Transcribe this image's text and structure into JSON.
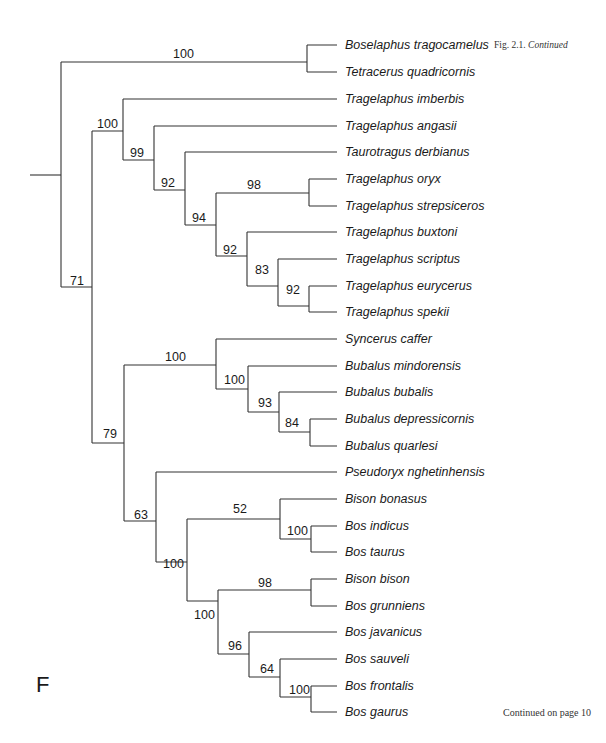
{
  "caption": {
    "figure": "Fig. 2.1.",
    "continued": "Continued"
  },
  "panel_letter": "F",
  "footer": "Continued on page 10",
  "tree": {
    "line_color": "#333333",
    "leaves": [
      {
        "name": "Boselaphus tragocamelus",
        "y": 45
      },
      {
        "name": "Tetracerus quadricornis",
        "y": 72
      },
      {
        "name": "Tragelaphus imberbis",
        "y": 99
      },
      {
        "name": "Tragelaphus angasii",
        "y": 126
      },
      {
        "name": "Taurotragus derbianus",
        "y": 152
      },
      {
        "name": "Tragelaphus oryx",
        "y": 179
      },
      {
        "name": "Tragelaphus strepsiceros",
        "y": 206
      },
      {
        "name": "Tragelaphus buxtoni",
        "y": 232
      },
      {
        "name": "Tragelaphus scriptus",
        "y": 259
      },
      {
        "name": "Tragelaphus eurycerus",
        "y": 286
      },
      {
        "name": "Tragelaphus spekii",
        "y": 312
      },
      {
        "name": "Syncerus caffer",
        "y": 339
      },
      {
        "name": "Bubalus mindorensis",
        "y": 366
      },
      {
        "name": "Bubalus bubalis",
        "y": 392
      },
      {
        "name": "Bubalus depressicornis",
        "y": 419
      },
      {
        "name": "Bubalus quarlesi",
        "y": 446
      },
      {
        "name": "Pseudoryx nghetinhensis",
        "y": 472
      },
      {
        "name": "Bison bonasus",
        "y": 499
      },
      {
        "name": "Bos indicus",
        "y": 526
      },
      {
        "name": "Bos taurus",
        "y": 552
      },
      {
        "name": "Bison bison",
        "y": 579
      },
      {
        "name": "Bos grunniens",
        "y": 606
      },
      {
        "name": "Bos javanicus",
        "y": 632
      },
      {
        "name": "Bos sauveli",
        "y": 659
      },
      {
        "name": "Bos frontalis",
        "y": 686
      },
      {
        "name": "Bos gaurus",
        "y": 712
      }
    ],
    "support_values": [
      {
        "label": "100",
        "x": 150,
        "y": 20
      },
      {
        "label": "100",
        "x": 97,
        "y": 117
      },
      {
        "label": "99",
        "x": 130,
        "y": 147
      },
      {
        "label": "92",
        "x": 161,
        "y": 177
      },
      {
        "label": "94",
        "x": 192,
        "y": 212
      },
      {
        "label": "98",
        "x": 248,
        "y": 180
      },
      {
        "label": "92",
        "x": 223,
        "y": 243
      },
      {
        "label": "83",
        "x": 255,
        "y": 263
      },
      {
        "label": "92",
        "x": 286,
        "y": 283
      },
      {
        "label": "71",
        "x": 70,
        "y": 274
      },
      {
        "label": "100",
        "x": 165,
        "y": 347
      },
      {
        "label": "100",
        "x": 223,
        "y": 373
      },
      {
        "label": "93",
        "x": 258,
        "y": 396
      },
      {
        "label": "84",
        "x": 285,
        "y": 416
      },
      {
        "label": "79",
        "x": 103,
        "y": 425
      },
      {
        "label": "63",
        "x": 134,
        "y": 508
      },
      {
        "label": "52",
        "x": 233,
        "y": 502
      },
      {
        "label": "100",
        "x": 163,
        "y": 556
      },
      {
        "label": "100",
        "x": 287,
        "y": 524
      },
      {
        "label": "98",
        "x": 258,
        "y": 576
      },
      {
        "label": "100",
        "x": 194,
        "y": 610
      },
      {
        "label": "96",
        "x": 230,
        "y": 640
      },
      {
        "label": "64",
        "x": 260,
        "y": 663
      },
      {
        "label": "100",
        "x": 289,
        "y": 683
      }
    ]
  }
}
